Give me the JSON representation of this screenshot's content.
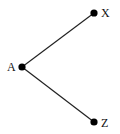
{
  "diagram": {
    "type": "tree",
    "nodes": [
      {
        "id": "A",
        "label": "A",
        "x": 22,
        "y": 67
      },
      {
        "id": "X",
        "label": "X",
        "x": 94,
        "y": 13
      },
      {
        "id": "Z",
        "label": "Z",
        "x": 94,
        "y": 122
      }
    ],
    "edges": [
      {
        "from": "A",
        "to": "X"
      },
      {
        "from": "A",
        "to": "Z"
      }
    ],
    "colors": {
      "line": "#222222",
      "node": "#000000",
      "background": "#ffffff"
    }
  }
}
